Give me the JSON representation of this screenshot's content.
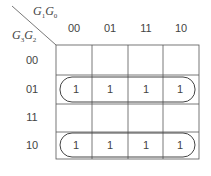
{
  "kmap": {
    "col_var": {
      "main": "G",
      "sub1": "1",
      "main2": "G",
      "sub2": "0"
    },
    "row_var": {
      "main": "G",
      "sub1": "3",
      "main2": "G",
      "sub2": "2"
    },
    "columns": [
      "00",
      "01",
      "11",
      "10"
    ],
    "rows": [
      "00",
      "01",
      "11",
      "10"
    ],
    "cells": [
      [
        "",
        "",
        "",
        ""
      ],
      [
        "1",
        "1",
        "1",
        "1"
      ],
      [
        "",
        "",
        "",
        ""
      ],
      [
        "1",
        "1",
        "1",
        "1"
      ]
    ],
    "groups": [
      {
        "row": 1,
        "cols": [
          0,
          3
        ]
      },
      {
        "row": 3,
        "cols": [
          0,
          3
        ]
      }
    ],
    "line_color": "#555555"
  }
}
